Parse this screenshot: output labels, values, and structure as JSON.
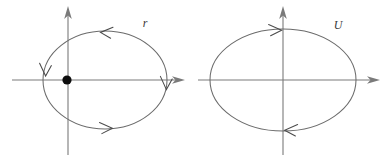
{
  "figure": {
    "background_color": "#ffffff",
    "line_color": "#6b6b6b",
    "axis_color": "#7a7a7a",
    "arrow_color": "#4a4a4a",
    "dot_color": "#0d0d0d",
    "label_color": "#3a3a3a",
    "panels": [
      {
        "id": "left-panel",
        "label": "r",
        "label_x": 145,
        "label_y": 27,
        "description": "ellipse with marked focus dot on vertical axis, counterclockwise flow",
        "ellipse": {
          "cx": 105,
          "cy": 80,
          "rx": 62,
          "ry": 49
        },
        "x_axis": {
          "x1": 12,
          "y1": 80,
          "x2": 182,
          "y2": 80,
          "arrow": "right"
        },
        "y_axis": {
          "x1": 68,
          "y1": 155,
          "x2": 68,
          "y2": 8,
          "arrow": "up"
        },
        "focus_dot": {
          "cx": 67,
          "cy": 80,
          "r": 4.6
        },
        "flow_direction": "counterclockwise",
        "arrow_markers": [
          {
            "name": "top-arrow",
            "x": 104,
            "y": 32,
            "direction": "left"
          },
          {
            "name": "bottom-arrow",
            "x": 108,
            "y": 128,
            "direction": "right"
          },
          {
            "name": "left-arrow",
            "x": 45,
            "y": 72,
            "direction": "down"
          },
          {
            "name": "right-arrow",
            "x": 166,
            "y": 86,
            "direction": "down"
          }
        ]
      },
      {
        "id": "right-panel",
        "label": "U",
        "label_x": 338,
        "label_y": 29,
        "description": "ellipse centered on axes, clockwise flow",
        "ellipse": {
          "cx": 283,
          "cy": 80,
          "rx": 73,
          "ry": 51
        },
        "x_axis": {
          "x1": 198,
          "y1": 80,
          "x2": 380,
          "y2": 80,
          "arrow": "right"
        },
        "y_axis": {
          "x1": 283,
          "y1": 155,
          "x2": 283,
          "y2": 8,
          "arrow": "up"
        },
        "focus_dot": null,
        "flow_direction": "clockwise",
        "arrow_markers": [
          {
            "name": "top-arrow",
            "x": 279,
            "y": 30,
            "direction": "right"
          },
          {
            "name": "bottom-arrow",
            "x": 287,
            "y": 130,
            "direction": "left"
          }
        ]
      }
    ]
  }
}
